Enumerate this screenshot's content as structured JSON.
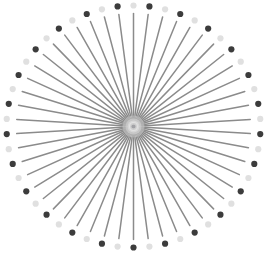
{
  "figure": {
    "kind": "radial-starburst-pattern",
    "canvas": {
      "width": 266,
      "height": 265,
      "background": "#ffffff"
    },
    "center": {
      "x": 133.5,
      "y": 126.5
    },
    "spokes": {
      "count": 50,
      "start_angle_deg": 90,
      "step_deg": 7.2,
      "line": {
        "color": "#8b8b8b",
        "width": 1.5,
        "inner_radius": 3,
        "outer_rx": 117,
        "outer_ry": 113,
        "cap": "round"
      },
      "dots": {
        "ring_rx": 127,
        "ring_ry": 121,
        "radius": 3.1,
        "even_color": "#e0e0e0",
        "odd_color": "#3c3c3c",
        "pattern": "alternating light/dark around ring, light dot at top, dark dot at bottom"
      }
    },
    "center_glow": {
      "halo_color": "#ffffff",
      "halo_radii": [
        11,
        8,
        6,
        4.5
      ],
      "halo_opacity": 0.3,
      "soft_dot_color": "#a9a9a9",
      "soft_dot_radius": 3.4,
      "soft_dot_opacity": 0.35,
      "dot_color": "#97979b",
      "dot_radius": 2.1,
      "dot_opacity": 0.85
    }
  }
}
